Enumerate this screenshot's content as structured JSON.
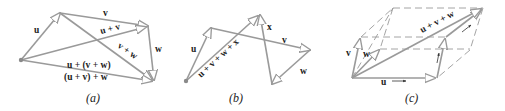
{
  "figures": [
    {
      "id": "a",
      "caption": "(a)",
      "vectors": [
        "u",
        "v",
        "w"
      ],
      "labels": {
        "u": "u",
        "v": "v",
        "w": "w",
        "u_plus_v": "u + v",
        "v_plus_w": "v + w",
        "u_plus_vw": "u + (v + w)",
        "uv_plus_w": "(u + v) + w"
      }
    },
    {
      "id": "b",
      "caption": "(b)",
      "vectors": [
        "u",
        "v",
        "w",
        "x"
      ],
      "labels": {
        "u": "u",
        "v": "v",
        "w": "w",
        "x": "x",
        "sum": "u + v + w + x"
      }
    },
    {
      "id": "c",
      "caption": "(c)",
      "vectors": [
        "u",
        "v",
        "w"
      ],
      "labels": {
        "u": "u",
        "v": "v",
        "w": "w",
        "sum": "u + v + w"
      }
    }
  ],
  "colors": {
    "vector": "#9a9a9a",
    "text": "#222222",
    "background": "#ffffff"
  }
}
